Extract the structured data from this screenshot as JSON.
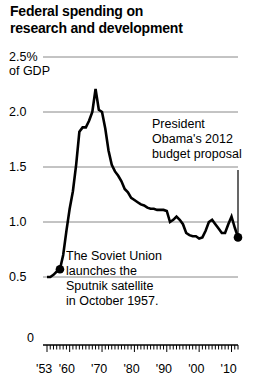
{
  "title": {
    "line1": "Federal spending on",
    "line2": "research and development"
  },
  "axis": {
    "y_unit_top": "2.5%",
    "y_unit_sub": "of GDP",
    "y_ticks": [
      "2.0",
      "1.5",
      "1.0",
      "0.5",
      "0"
    ],
    "x_ticks": [
      "'53",
      "'60",
      "'70",
      "'80",
      "'90",
      "'00",
      "'10"
    ]
  },
  "annotations": {
    "obama": {
      "line1": "President",
      "line2": "Obama's 2012",
      "line3": "budget proposal"
    },
    "sputnik": {
      "line1": "The Soviet Union",
      "line2": "launches the",
      "line3": "Sputnik satellite",
      "line4": "in October 1957."
    }
  },
  "colors": {
    "line": "#000000",
    "grid": "#888888",
    "text": "#000000",
    "background": "#ffffff"
  },
  "chart_data": {
    "type": "line",
    "title": "Federal spending on research and development",
    "xlabel": "",
    "ylabel": "2.5% of GDP",
    "ylim": [
      0,
      2.5
    ],
    "xlim": [
      1953,
      2012
    ],
    "grid": true,
    "legend": "none",
    "ytick_values": [
      0.5,
      1.0,
      1.5,
      2.0,
      2.5
    ],
    "xtick_values": [
      1953,
      1960,
      1970,
      1980,
      1990,
      2000,
      2010
    ],
    "markers": [
      {
        "x": 1957,
        "y": 0.57,
        "label": "Sputnik launch"
      },
      {
        "x": 2012,
        "y": 0.86,
        "label": "Obama 2012 budget proposal"
      }
    ],
    "series": [
      {
        "name": "Federal R&D spending (% of GDP)",
        "x": [
          1953,
          1954,
          1955,
          1956,
          1957,
          1958,
          1959,
          1960,
          1961,
          1962,
          1963,
          1964,
          1965,
          1966,
          1967,
          1968,
          1969,
          1970,
          1971,
          1972,
          1973,
          1974,
          1975,
          1976,
          1977,
          1978,
          1979,
          1980,
          1981,
          1982,
          1983,
          1984,
          1985,
          1986,
          1987,
          1988,
          1989,
          1990,
          1991,
          1992,
          1993,
          1994,
          1995,
          1996,
          1997,
          1998,
          1999,
          2000,
          2001,
          2002,
          2003,
          2004,
          2005,
          2006,
          2007,
          2008,
          2009,
          2010,
          2011,
          2012
        ],
        "y": [
          0.5,
          0.5,
          0.52,
          0.55,
          0.57,
          0.7,
          0.92,
          1.12,
          1.28,
          1.52,
          1.82,
          1.86,
          1.86,
          1.92,
          2.0,
          2.21,
          2.02,
          2.0,
          1.85,
          1.65,
          1.52,
          1.46,
          1.42,
          1.37,
          1.3,
          1.27,
          1.22,
          1.2,
          1.18,
          1.16,
          1.15,
          1.13,
          1.12,
          1.12,
          1.11,
          1.11,
          1.11,
          1.1,
          1.0,
          1.02,
          1.05,
          1.02,
          0.98,
          0.9,
          0.88,
          0.87,
          0.87,
          0.85,
          0.86,
          0.92,
          1.0,
          1.02,
          0.98,
          0.94,
          0.9,
          0.9,
          0.98,
          1.05,
          0.95,
          0.86
        ]
      }
    ]
  }
}
